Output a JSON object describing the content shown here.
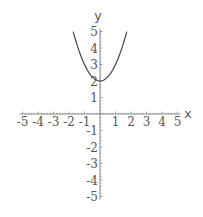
{
  "chart_data": {
    "type": "line",
    "title": "",
    "xlabel": "x",
    "ylabel": "y",
    "xlim": [
      -5,
      5
    ],
    "ylim": [
      -5,
      5
    ],
    "grid": false,
    "legend": null,
    "x_ticks": [
      -5,
      -4,
      -3,
      -2,
      -1,
      1,
      2,
      3,
      4,
      5
    ],
    "y_ticks": [
      -5,
      -4,
      -3,
      -2,
      -1,
      1,
      2,
      3,
      4,
      5
    ],
    "x_tick_labels": [
      "-5",
      "-4",
      "-3",
      "-2",
      "-1",
      "1",
      "2",
      "3",
      "4",
      "5"
    ],
    "y_tick_labels": [
      "-5",
      "-4",
      "-3",
      "-2",
      "-1",
      "1",
      "2",
      "3",
      "4",
      "5"
    ],
    "series": [
      {
        "name": "y = x^2 + 2",
        "x": [
          -1.73,
          -1.5,
          -1.25,
          -1.0,
          -0.75,
          -0.5,
          -0.25,
          0,
          0.25,
          0.5,
          0.75,
          1.0,
          1.25,
          1.5,
          1.73
        ],
        "y": [
          5.0,
          4.25,
          3.56,
          3.0,
          2.56,
          2.25,
          2.06,
          2.0,
          2.06,
          2.25,
          2.56,
          3.0,
          3.56,
          4.25,
          5.0
        ],
        "color": "#444444"
      }
    ]
  },
  "colors": {
    "axis": "#888888",
    "curve": "#444444",
    "text": "#555555"
  }
}
